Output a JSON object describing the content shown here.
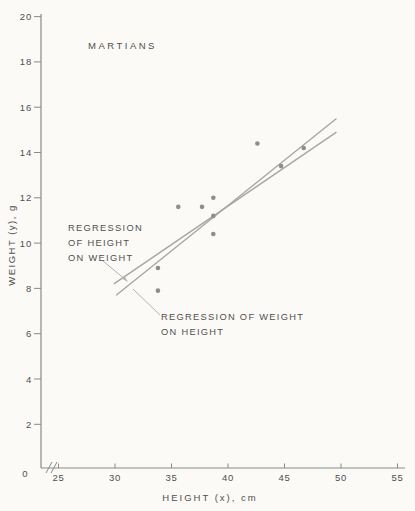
{
  "figure": {
    "title": "MARTIANS",
    "x_axis_label": "HEIGHT (x), cm",
    "y_axis_label": "WEIGHT (y), g",
    "origin_label": "0"
  },
  "annotations": {
    "height_on_weight": {
      "lines": [
        "REGRESSION",
        "OF HEIGHT",
        "ON WEIGHT"
      ]
    },
    "weight_on_height": {
      "lines": [
        "REGRESSION OF WEIGHT",
        "ON HEIGHT"
      ]
    }
  },
  "chart_data": {
    "type": "scatter",
    "title": "MARTIANS",
    "xlabel": "HEIGHT (x), cm",
    "ylabel": "WEIGHT (y), g",
    "xlim": [
      25,
      55
    ],
    "ylim": [
      0,
      20
    ],
    "x_ticks": [
      25,
      30,
      35,
      40,
      45,
      50,
      55
    ],
    "y_ticks": [
      2,
      4,
      6,
      8,
      10,
      12,
      14,
      16,
      18,
      20
    ],
    "axis_break_on_x": true,
    "grid": false,
    "legend_position": "none",
    "points": [
      [
        33.8,
        7.9
      ],
      [
        33.8,
        8.9
      ],
      [
        35.6,
        11.6
      ],
      [
        37.7,
        11.6
      ],
      [
        38.7,
        12.0
      ],
      [
        38.7,
        11.2
      ],
      [
        38.7,
        10.4
      ],
      [
        42.6,
        14.4
      ],
      [
        44.7,
        13.4
      ],
      [
        46.7,
        14.2
      ]
    ],
    "regression_lines": [
      {
        "name": "regression-of-height-on-weight",
        "x1": 30.1,
        "y1": 7.7,
        "x2": 49.6,
        "y2": 15.5
      },
      {
        "name": "regression-of-weight-on-height",
        "x1": 29.9,
        "y1": 8.2,
        "x2": 49.6,
        "y2": 14.9
      }
    ],
    "colors": {
      "background": "#fbfaf7",
      "axis": "#8a8a8a",
      "text": "#4f4f4f",
      "points": "#8d8d8d",
      "regression_lines": "#a6a6a6",
      "leader_lines": "#b3b3b3"
    }
  }
}
